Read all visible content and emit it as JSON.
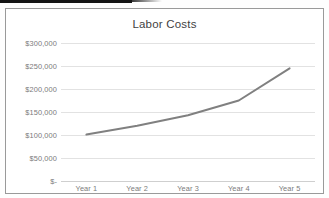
{
  "chart_data": {
    "type": "line",
    "title": "Labor Costs",
    "xlabel": "",
    "ylabel": "",
    "categories": [
      "Year 1",
      "Year 2",
      "Year 3",
      "Year 4",
      "Year 5"
    ],
    "series": [
      {
        "name": "Labor Costs",
        "values": [
          101000,
          120000,
          143000,
          175000,
          245000
        ],
        "color": "#808080",
        "markers": false,
        "line_width": 2
      }
    ],
    "ylim": [
      0,
      300000
    ],
    "y_ticks": [
      0,
      50000,
      100000,
      150000,
      200000,
      250000,
      300000
    ],
    "y_tick_labels": [
      "$-",
      "$50,000",
      "$100,000",
      "$150,000",
      "$200,000",
      "$250,000",
      "$300,000"
    ],
    "grid": true,
    "grid_orientation": "horizontal",
    "legend": false,
    "legend_position": "none"
  },
  "style": {
    "title_color": "#3f3f3f",
    "tick_label_color": "#7b7b7b",
    "gridline_color": "#e2e2e2",
    "axis_line_color": "#cfcfcf",
    "series_color": "#808080",
    "frame_border_color": "#9a9a9a",
    "plot_background": "#ffffff"
  }
}
